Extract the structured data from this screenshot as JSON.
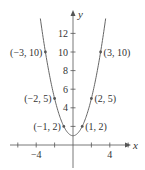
{
  "chart_data": {
    "type": "line",
    "title": "",
    "function": "y = x^2 + 1",
    "xlabel": "x",
    "ylabel": "y",
    "xlim": [
      -7.5,
      6.5
    ],
    "ylim": [
      -2.5,
      14.2
    ],
    "x_ticks": [
      -6,
      -4,
      -2,
      2,
      4,
      6
    ],
    "x_tick_labels": [
      {
        "value": -4,
        "label": "−4"
      },
      {
        "value": 4,
        "label": "4"
      }
    ],
    "y_ticks": [
      2,
      4,
      6,
      8,
      10,
      12
    ],
    "y_tick_labels": [
      {
        "value": 4,
        "label": "4"
      },
      {
        "value": 6,
        "label": "6"
      },
      {
        "value": 8,
        "label": "8"
      },
      {
        "value": 10,
        "label": "10"
      },
      {
        "value": 12,
        "label": "12"
      }
    ],
    "grid": false,
    "legend": null,
    "color": "#666666",
    "points": [
      {
        "x": -3,
        "y": 10,
        "label": "(−3, 10)"
      },
      {
        "x": 3,
        "y": 10,
        "label": "(3, 10)"
      },
      {
        "x": -2,
        "y": 5,
        "label": "(−2, 5)"
      },
      {
        "x": 2,
        "y": 5,
        "label": "(2, 5)"
      },
      {
        "x": -1,
        "y": 2,
        "label": "(−1, 2)"
      },
      {
        "x": 1,
        "y": 2,
        "label": "(1, 2)"
      }
    ]
  }
}
